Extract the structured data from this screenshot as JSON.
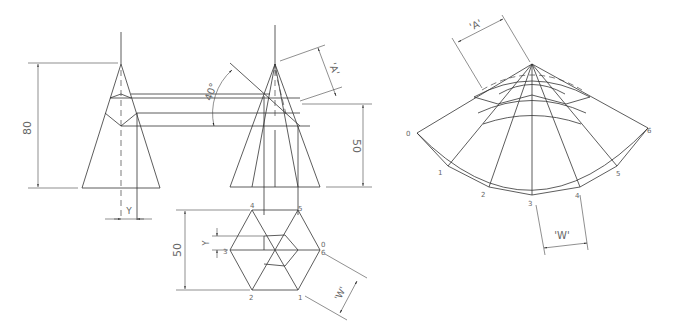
{
  "dimensions": {
    "height_80": "80",
    "height_50": "50",
    "hex_50": "50",
    "angle": "40°",
    "true_length": "'A'",
    "width_w": "'W'",
    "offset_y": "Y"
  },
  "hex_labels": [
    "0",
    "1",
    "2",
    "3",
    "4",
    "5",
    "6"
  ],
  "development_labels": [
    "0",
    "1",
    "2",
    "3",
    "4",
    "5",
    "6"
  ],
  "views": {
    "front_left": "elevation-cone-left",
    "front_right": "elevation-cone-right",
    "plan": "hexagon-plan",
    "development": "surface-development"
  }
}
